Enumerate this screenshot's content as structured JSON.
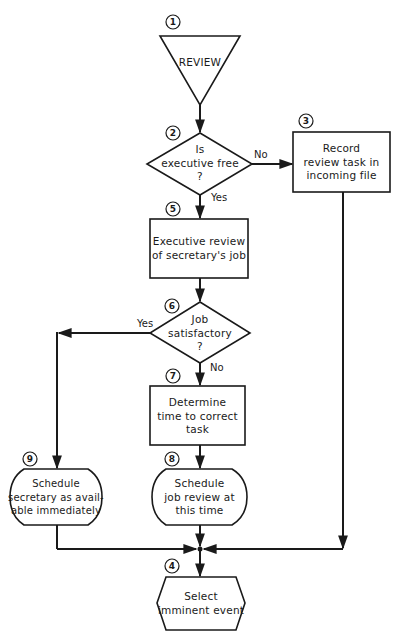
{
  "diagram": {
    "type": "flowchart",
    "nodes": [
      {
        "id": "1",
        "number": "1",
        "shape": "inverted-triangle",
        "text": "REVIEW"
      },
      {
        "id": "2",
        "number": "2",
        "shape": "diamond",
        "lines": [
          "Is",
          "executive free",
          "?"
        ]
      },
      {
        "id": "3",
        "number": "3",
        "shape": "rectangle",
        "lines": [
          "Record",
          "review task in",
          "incoming file"
        ]
      },
      {
        "id": "5",
        "number": "5",
        "shape": "rectangle",
        "lines": [
          "Executive review",
          "of secretary's job"
        ]
      },
      {
        "id": "6",
        "number": "6",
        "shape": "diamond",
        "lines": [
          "Job",
          "satisfactory",
          "?"
        ]
      },
      {
        "id": "7",
        "number": "7",
        "shape": "rectangle",
        "lines": [
          "Determine",
          "time to correct",
          "task"
        ]
      },
      {
        "id": "8",
        "number": "8",
        "shape": "terminal",
        "lines": [
          "Schedule",
          "job review at",
          "this time"
        ]
      },
      {
        "id": "9",
        "number": "9",
        "shape": "terminal",
        "lines": [
          "Schedule",
          "secretary as avail-",
          "able immediately"
        ]
      },
      {
        "id": "4",
        "number": "4",
        "shape": "hexagon",
        "lines": [
          "Select",
          "imminent event"
        ]
      }
    ],
    "edges": [
      {
        "from": "1",
        "to": "2",
        "label": ""
      },
      {
        "from": "2",
        "to": "3",
        "label": "No"
      },
      {
        "from": "2",
        "to": "5",
        "label": "Yes"
      },
      {
        "from": "3",
        "to": "4",
        "label": ""
      },
      {
        "from": "5",
        "to": "6",
        "label": ""
      },
      {
        "from": "6",
        "to": "9",
        "label": "Yes"
      },
      {
        "from": "6",
        "to": "7",
        "label": "No"
      },
      {
        "from": "7",
        "to": "8",
        "label": ""
      },
      {
        "from": "8",
        "to": "4",
        "label": ""
      },
      {
        "from": "9",
        "to": "4",
        "label": ""
      }
    ],
    "edge_labels": {
      "no_2": "No",
      "yes_2": "Yes",
      "yes_6": "Yes",
      "no_6": "No"
    },
    "colors": {
      "ink": "#1a1a1a",
      "background": "#ffffff"
    }
  }
}
